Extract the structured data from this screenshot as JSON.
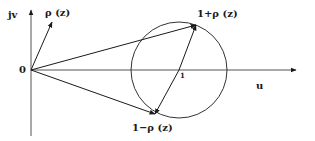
{
  "diagram": {
    "type": "complex-plane-vector-diagram",
    "axes": {
      "horizontal_label": "u",
      "vertical_label": "jv",
      "origin_label": "0"
    },
    "circle": {
      "center_label": "1",
      "center": [
        179,
        70
      ],
      "radius": 48
    },
    "vectors": [
      {
        "name": "rho",
        "label": "ρ (z)",
        "from": [
          31,
          70
        ],
        "to": [
          52,
          22
        ]
      },
      {
        "name": "one-plus-rho",
        "label": "1+ρ (z)",
        "from": [
          31,
          70
        ],
        "to": [
          196,
          25
        ]
      },
      {
        "name": "one-minus-rho",
        "label": "1−ρ (z)",
        "from": [
          31,
          70
        ],
        "to": [
          155,
          114
        ]
      },
      {
        "name": "diameter",
        "label": "",
        "from": [
          196,
          25
        ],
        "to": [
          155,
          114
        ]
      }
    ],
    "colors": {
      "ink": "#1a1a1a",
      "axis": "#555555",
      "background": "#ffffff"
    }
  }
}
